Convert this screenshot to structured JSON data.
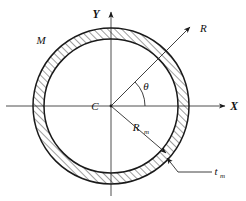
{
  "figure": {
    "type": "engineering-cross-section-diagram",
    "background_color": "#ffffff",
    "line_color": "#1a1a1a",
    "axis_color": "#3a3a3a"
  },
  "axes": {
    "x_label": "X",
    "y_label": "Y",
    "origin_label": "C"
  },
  "labels": {
    "material": "M",
    "outer_radius": "R",
    "mean_radius": "R",
    "mean_radius_sub": "m",
    "thickness": "t",
    "thickness_sub": "m",
    "angle": "θ"
  },
  "geometry": {
    "center_x": 111,
    "center_y": 106,
    "outer_radius_px": 78,
    "inner_radius_px": 67,
    "mean_radius_px": 72.5,
    "wall_thickness_px": 11,
    "theta_angle_deg": 45,
    "theta_arc_radius_px": 34
  },
  "annotations": [
    {
      "name": "M",
      "position": "upper-left-outside",
      "kind": "material-designator"
    },
    {
      "name": "R",
      "position": "upper-right",
      "kind": "radius-arrow-outward"
    },
    {
      "name": "Rm",
      "position": "lower-right-inside",
      "kind": "mean-radius-arrow"
    },
    {
      "name": "tm",
      "position": "bottom-right-outside",
      "kind": "thickness-leader"
    },
    {
      "name": "theta",
      "position": "first-quadrant",
      "kind": "angle-arc"
    },
    {
      "name": "C",
      "position": "left-of-origin",
      "kind": "centroid-marker"
    }
  ]
}
